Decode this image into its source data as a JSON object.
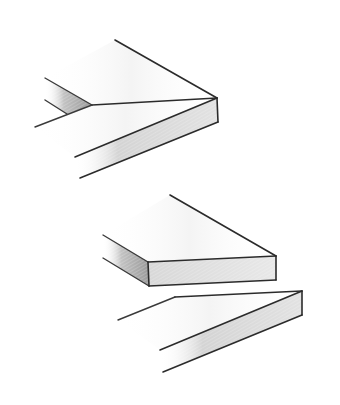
{
  "figure": {
    "parts": [
      {
        "id": "assembled-miter-joint",
        "label": ""
      },
      {
        "id": "separated-boards",
        "label": ""
      }
    ],
    "colors": {
      "line": "#2b2b2b",
      "face_shade_dark": "#bdbdbd",
      "face_shade_light": "#e6e6e6",
      "background": "#ffffff"
    }
  }
}
